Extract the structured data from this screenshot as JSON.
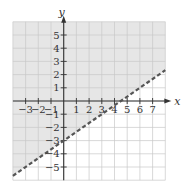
{
  "chart_data": {
    "type": "line",
    "title": "",
    "xlabel": "x",
    "ylabel": "y",
    "xlim": [
      -4,
      8
    ],
    "ylim": [
      -6,
      6
    ],
    "grid": true,
    "x_ticks": [
      -3,
      -2,
      -1,
      1,
      2,
      3,
      4,
      5,
      6,
      7
    ],
    "x_tick_labels": [
      "−3",
      "−2",
      "−1",
      "1",
      "2",
      "3",
      "4",
      "5",
      "6",
      "7"
    ],
    "y_ticks": [
      5,
      4,
      3,
      2,
      1,
      -1,
      -2,
      -3,
      -4,
      -5
    ],
    "y_tick_labels": [
      "5",
      "4",
      "3",
      "2",
      "1",
      "−1",
      "−2",
      "−3",
      "−4",
      "−5"
    ],
    "series": [
      {
        "name": "boundary",
        "style": "dashed",
        "slope": 0.6667,
        "intercept": -3,
        "x": [
          -4,
          8
        ],
        "y": [
          -5.667,
          2.333
        ]
      }
    ],
    "shaded_region": "above boundary",
    "inequality": "y > (2/3)x − 3",
    "colors": {
      "shade": "#e6e6e6",
      "grid": "#c8c8c8",
      "axis": "#333333",
      "boundary": "#555555"
    }
  }
}
